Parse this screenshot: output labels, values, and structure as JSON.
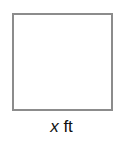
{
  "diagram": {
    "shape": "square",
    "border_color": "#8c8c8c",
    "side_label": {
      "variable": "x",
      "unit": "ft"
    }
  }
}
